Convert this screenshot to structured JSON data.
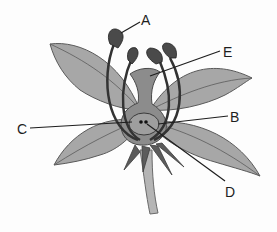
{
  "diagram": {
    "labels": {
      "A": "A",
      "B": "B",
      "C": "C",
      "D": "D",
      "E": "E"
    },
    "colors": {
      "background": "#fdfdfd",
      "petal": "#a7a7a7",
      "petal_stroke": "#5a5a5a",
      "pistil": "#8c8c8c",
      "ovary": "#999999",
      "stamen": "#3a3a3a",
      "sepal": "#5c5c5c",
      "stem": "#b5b5b5",
      "leader_line": "#1e1e1e"
    }
  }
}
